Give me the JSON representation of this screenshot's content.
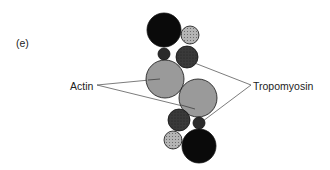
{
  "panel_label": "(e)",
  "labels": {
    "actin": "Actin",
    "tropomyosin": "Tropomyosin"
  },
  "colors": {
    "actin_fill": "#9a9a9a",
    "tropomyosin_dark": "#3a3a3a",
    "tropomyosin_light": "#b5b5b5",
    "black_subunit": "#0a0a0a",
    "outline": "#111111",
    "leader_line": "#444444"
  },
  "diagram": {
    "components": [
      {
        "name": "large-black-top",
        "cx": 164,
        "cy": 30,
        "r": 17,
        "fill": "black"
      },
      {
        "name": "light-dotted-top",
        "cx": 190,
        "cy": 35,
        "r": 9,
        "fill": "light-dotted"
      },
      {
        "name": "small-dark-top",
        "cx": 164,
        "cy": 54,
        "r": 6,
        "fill": "dark"
      },
      {
        "name": "dark-dotted-top",
        "cx": 187,
        "cy": 57,
        "r": 11,
        "fill": "dark-dotted"
      },
      {
        "name": "actin-top",
        "cx": 165,
        "cy": 79,
        "r": 19,
        "fill": "gray"
      },
      {
        "name": "actin-bottom",
        "cx": 198,
        "cy": 98,
        "r": 19,
        "fill": "gray"
      },
      {
        "name": "dark-dotted-bottom",
        "cx": 179,
        "cy": 120,
        "r": 11,
        "fill": "dark-dotted"
      },
      {
        "name": "small-dark-bottom",
        "cx": 199,
        "cy": 123,
        "r": 6,
        "fill": "dark"
      },
      {
        "name": "light-dotted-bottom",
        "cx": 173,
        "cy": 140,
        "r": 9,
        "fill": "light-dotted"
      },
      {
        "name": "large-black-bottom",
        "cx": 199,
        "cy": 146,
        "r": 17,
        "fill": "black"
      }
    ]
  }
}
